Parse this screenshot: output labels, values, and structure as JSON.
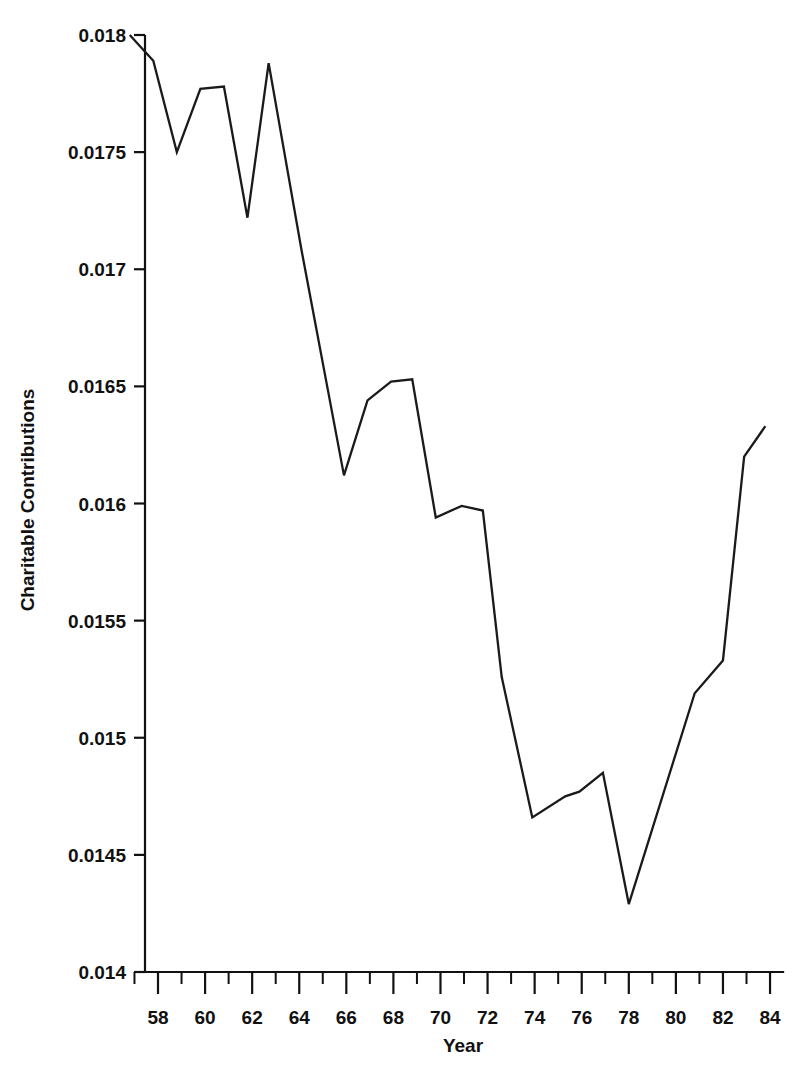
{
  "chart_data": {
    "type": "line",
    "title": "",
    "subtitle": "",
    "xlabel": "Year",
    "ylabel": "Charitable Contributions",
    "xlim": [
      56.8,
      84.6
    ],
    "ylim": [
      0.014,
      0.018
    ],
    "grid": false,
    "legend": null,
    "x_tick_labels": [
      "58",
      "60",
      "62",
      "64",
      "66",
      "68",
      "70",
      "72",
      "74",
      "76",
      "78",
      "80",
      "82",
      "84"
    ],
    "x_tick_values": [
      58,
      60,
      62,
      64,
      66,
      68,
      70,
      72,
      74,
      76,
      78,
      80,
      82,
      84
    ],
    "x_minor_tick_values": [
      57,
      59,
      61,
      63,
      65,
      67,
      69,
      71,
      73,
      75,
      77,
      79,
      81,
      83
    ],
    "y_tick_labels": [
      "0.018",
      "0.0175",
      "0.017",
      "0.0165",
      "0.016",
      "0.0155",
      "0.015",
      "0.0145",
      "0.014"
    ],
    "y_tick_values": [
      0.018,
      0.0175,
      0.017,
      0.0165,
      0.016,
      0.0155,
      0.015,
      0.0145,
      0.014
    ],
    "x": [
      56.8,
      57.8,
      58.8,
      59.8,
      60.8,
      61.8,
      62.7,
      64.1,
      65.9,
      66.9,
      67.9,
      68.8,
      69.8,
      70.9,
      71.8,
      72.6,
      73.9,
      75.3,
      75.9,
      76.9,
      78.0,
      80.8,
      82.0,
      82.9,
      83.8
    ],
    "values": [
      0.018,
      0.01789,
      0.0175,
      0.01777,
      0.01778,
      0.01722,
      0.01788,
      0.01708,
      0.01612,
      0.01644,
      0.01652,
      0.01653,
      0.01594,
      0.01599,
      0.01597,
      0.01526,
      0.01466,
      0.01475,
      0.01477,
      0.01485,
      0.01429,
      0.01519,
      0.01533,
      0.0162,
      0.01633
    ],
    "series": [
      {
        "name": "Charitable Contributions",
        "points": [
          [
            56.8,
            0.018
          ],
          [
            57.8,
            0.01789
          ],
          [
            58.8,
            0.0175
          ],
          [
            59.8,
            0.01777
          ],
          [
            60.8,
            0.01778
          ],
          [
            61.8,
            0.01722
          ],
          [
            62.7,
            0.01788
          ],
          [
            64.1,
            0.01708
          ],
          [
            65.9,
            0.01612
          ],
          [
            66.9,
            0.01644
          ],
          [
            67.9,
            0.01652
          ],
          [
            68.8,
            0.01653
          ],
          [
            69.8,
            0.01594
          ],
          [
            70.9,
            0.01599
          ],
          [
            71.8,
            0.01597
          ],
          [
            72.6,
            0.01526
          ],
          [
            73.9,
            0.01466
          ],
          [
            75.3,
            0.01475
          ],
          [
            75.9,
            0.01477
          ],
          [
            76.9,
            0.01485
          ],
          [
            78.0,
            0.01429
          ],
          [
            80.8,
            0.01519
          ],
          [
            82.0,
            0.01533
          ],
          [
            82.9,
            0.0162
          ],
          [
            83.8,
            0.01633
          ]
        ]
      }
    ],
    "line_color": "#1a1a1a",
    "background_color": "#ffffff"
  }
}
